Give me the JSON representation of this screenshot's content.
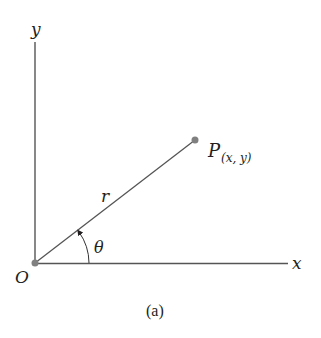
{
  "diagram": {
    "caption": "(a)",
    "axes": {
      "x_label": "x",
      "y_label": "y"
    },
    "origin_label": "O",
    "point": {
      "name": "P",
      "coords": "(x, y)"
    },
    "radius_label": "r",
    "angle_label": "θ",
    "colors": {
      "line": "#4a4a4a",
      "dot": "#808080",
      "text": "#231f20"
    }
  }
}
